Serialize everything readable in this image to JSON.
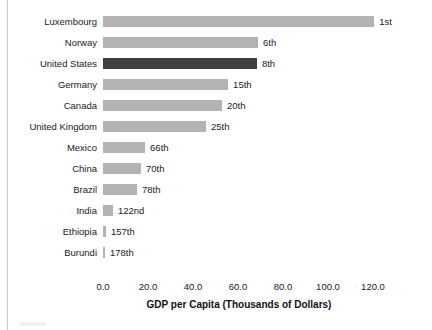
{
  "chart_data": {
    "type": "bar",
    "orientation": "horizontal",
    "title": "",
    "subtitle": "",
    "xlabel": "GDP per Capita (Thousands of Dollars)",
    "ylabel": "",
    "xlim": [
      0,
      128
    ],
    "xticks": [
      0.0,
      20.0,
      40.0,
      60.0,
      80.0,
      100.0,
      120.0
    ],
    "xtick_labels": [
      "0.0",
      "20.0",
      "40.0",
      "60.0",
      "80.0",
      "100.0",
      "120.0"
    ],
    "grid": false,
    "legend": "none",
    "highlight_color": "#404040",
    "bar_color": "#b3b3b3",
    "highlighted_category": "United States",
    "categories": [
      "Luxembourg",
      "Norway",
      "United States",
      "Germany",
      "Canada",
      "United Kingdom",
      "Mexico",
      "China",
      "Brazil",
      "India",
      "Ethiopia",
      "Burundi"
    ],
    "values": [
      120.5,
      68.9,
      68.4,
      55.6,
      52.9,
      45.8,
      18.7,
      16.9,
      15.1,
      4.4,
      1.3,
      0.3
    ],
    "annotations": [
      "1st",
      "6th",
      "8th",
      "15th",
      "20th",
      "25th",
      "66th",
      "70th",
      "78th",
      "122nd",
      "157th",
      "178th"
    ]
  }
}
